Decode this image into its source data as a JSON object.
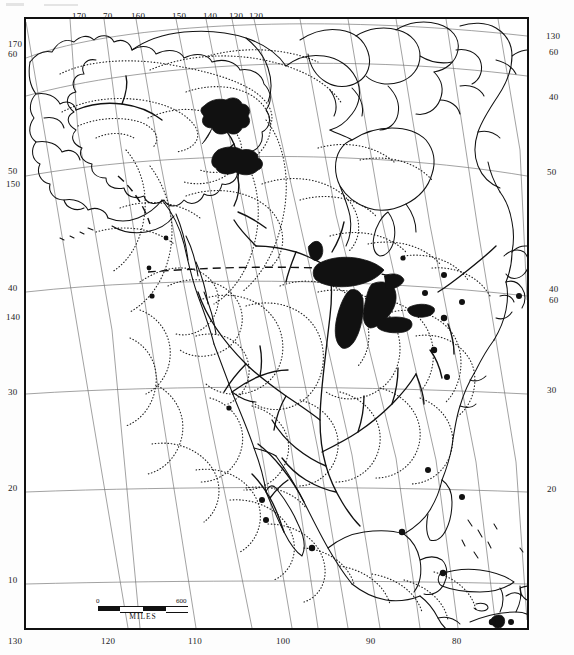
{
  "document": {
    "type": "map",
    "title": "North America physiographic / reference map",
    "description": "Outline map of North America with graticule, dotted regional boundaries, major rivers, black-filled Great Lakes, Great Bear Lake, Great Slave Lake and Lake Winnipeg, and black point symbols at coastal city locations."
  },
  "scale": {
    "start_label": "0",
    "end_label": "600",
    "unit_label": "MILES"
  },
  "graticule": {
    "top_labels": [
      {
        "text": "170",
        "x": 72,
        "y": 11
      },
      {
        "text": "70",
        "x": 103,
        "y": 11
      },
      {
        "text": "160",
        "x": 131,
        "y": 11
      },
      {
        "text": "150",
        "x": 172,
        "y": 11
      },
      {
        "text": "140",
        "x": 203,
        "y": 11
      },
      {
        "text": "130",
        "x": 229,
        "y": 11
      },
      {
        "text": "120",
        "x": 249,
        "y": 11
      }
    ],
    "left_labels": [
      {
        "text": "170",
        "x": 8,
        "y": 45
      },
      {
        "text": "60",
        "x": 8,
        "y": 55
      },
      {
        "text": "50",
        "x": 8,
        "y": 171
      },
      {
        "text": "150",
        "x": 8,
        "y": 184
      },
      {
        "text": "40",
        "x": 8,
        "y": 288
      },
      {
        "text": "140",
        "x": 8,
        "y": 317
      },
      {
        "text": "30",
        "x": 8,
        "y": 392
      },
      {
        "text": "20",
        "x": 8,
        "y": 488
      },
      {
        "text": "10",
        "x": 8,
        "y": 580
      },
      {
        "text": "130",
        "x": 5,
        "y": 638
      }
    ],
    "right_labels": [
      {
        "text": "130",
        "x": 548,
        "y": 36
      },
      {
        "text": "60",
        "x": 551,
        "y": 52
      },
      {
        "text": "40",
        "x": 551,
        "y": 97
      },
      {
        "text": "50",
        "x": 549,
        "y": 172
      },
      {
        "text": "40",
        "x": 551,
        "y": 289
      },
      {
        "text": "60",
        "x": 551,
        "y": 300
      },
      {
        "text": "30",
        "x": 549,
        "y": 390
      },
      {
        "text": "20",
        "x": 549,
        "y": 489
      }
    ],
    "bottom_labels": [
      {
        "text": "130",
        "x": 17,
        "y": 638
      },
      {
        "text": "120",
        "x": 110,
        "y": 638
      },
      {
        "text": "110",
        "x": 197,
        "y": 638
      },
      {
        "text": "100",
        "x": 285,
        "y": 638
      },
      {
        "text": "90",
        "x": 372,
        "y": 638
      },
      {
        "text": "80",
        "x": 458,
        "y": 638
      }
    ]
  },
  "colors": {
    "ink": "#111111",
    "paper": "#ffffff",
    "graticule": "#6d6d6d",
    "dotted": "#2a2a2a"
  },
  "features": {
    "filled_water": [
      "Great Bear Lake",
      "Great Slave Lake",
      "Lake Winnipeg",
      "Lake Superior",
      "Lake Michigan",
      "Lake Huron",
      "Lake Erie",
      "Lake Ontario",
      "Lake Maracaibo"
    ],
    "point_symbol_count": 18
  }
}
